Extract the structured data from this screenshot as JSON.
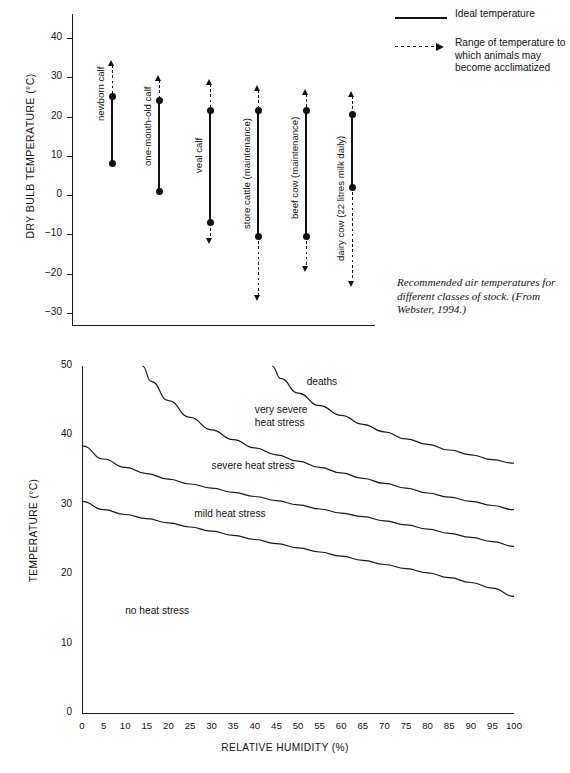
{
  "figure": {
    "caption": "Recommended air temperatures for different classes of stock. (From Webster, 1994.)"
  },
  "legend": {
    "items": [
      {
        "key": "solid-line",
        "label": "Ideal temperature"
      },
      {
        "key": "dashed-arrow-line",
        "label": "Range of temperature to which animals may become acclimatized"
      }
    ]
  },
  "chart_data": [
    {
      "type": "bar",
      "orientation": "vertical-range",
      "title": "",
      "xlabel": "",
      "ylabel": "DRY BULB TEMPERATURE (°C)",
      "ylim": [
        -35,
        45
      ],
      "yticks": [
        40,
        30,
        20,
        10,
        0,
        -10,
        -20,
        -30
      ],
      "ytick_labels": [
        "40",
        "30",
        "20",
        "10",
        "0",
        "−10",
        "−20",
        "−30"
      ],
      "grid": false,
      "legend_position": "top-right",
      "categories": [
        "newborn calf",
        "one-month-old calf",
        "veal calf",
        "store cattle (maintenance)",
        "beef cow (maintenance)",
        "dairy cow (22 litres milk daily)"
      ],
      "series": [
        {
          "name": "Ideal temperature (lower)",
          "values": [
            8,
            1,
            -7,
            -10.5,
            -10.5,
            2
          ]
        },
        {
          "name": "Ideal temperature (upper)",
          "values": [
            25,
            24,
            21.5,
            21.5,
            21.5,
            20.5
          ]
        },
        {
          "name": "Acclimatized range (lower)",
          "values": [
            8,
            1,
            -12.5,
            -27,
            -19.5,
            -23.5
          ]
        },
        {
          "name": "Acclimatized range (upper)",
          "values": [
            34.5,
            30.5,
            29.5,
            28,
            27,
            26.5
          ]
        }
      ]
    },
    {
      "type": "line",
      "title": "",
      "xlabel": "RELATIVE HUMIDITY (%)",
      "ylabel": "TEMPERATURE (°C)",
      "xlim": [
        0,
        100
      ],
      "ylim": [
        0,
        50
      ],
      "xticks": [
        0,
        5,
        10,
        15,
        20,
        25,
        30,
        35,
        40,
        45,
        50,
        55,
        60,
        65,
        70,
        75,
        80,
        85,
        90,
        95,
        100
      ],
      "yticks": [
        0,
        10,
        20,
        30,
        40,
        50
      ],
      "grid": false,
      "legend_position": "none",
      "annotations": [
        {
          "text": "deaths",
          "x": 52,
          "y": 47.5
        },
        {
          "text": "very severe heat stress",
          "x": 40,
          "y": 43.5
        },
        {
          "text": "severe heat stress",
          "x": 30,
          "y": 35.5
        },
        {
          "text": "mild heat stress",
          "x": 26,
          "y": 28.5
        },
        {
          "text": "no heat stress",
          "x": 10,
          "y": 14.5
        }
      ],
      "series": [
        {
          "name": "deaths boundary",
          "x": [
            44,
            46,
            50,
            55,
            60,
            65,
            70,
            75,
            80,
            85,
            90,
            95,
            100
          ],
          "y": [
            50,
            48.2,
            46.1,
            44.3,
            42.9,
            41.6,
            40.5,
            39.5,
            38.7,
            37.9,
            37.2,
            36.5,
            36.0
          ]
        },
        {
          "name": "very severe heat stress boundary",
          "x": [
            14,
            16,
            20,
            25,
            30,
            35,
            40,
            45,
            50,
            55,
            60,
            65,
            70,
            75,
            80,
            85,
            90,
            95,
            100
          ],
          "y": [
            50,
            47.8,
            45.0,
            42.6,
            40.8,
            39.4,
            38.2,
            37.2,
            36.3,
            35.4,
            34.6,
            33.8,
            33.1,
            32.4,
            31.7,
            31.1,
            30.5,
            29.9,
            29.3
          ]
        },
        {
          "name": "severe heat stress boundary",
          "x": [
            0,
            5,
            10,
            15,
            20,
            25,
            30,
            35,
            40,
            45,
            50,
            55,
            60,
            65,
            70,
            75,
            80,
            85,
            90,
            95,
            100
          ],
          "y": [
            38.5,
            36.6,
            35.4,
            34.5,
            33.7,
            33.0,
            32.4,
            31.8,
            31.2,
            30.6,
            30.0,
            29.4,
            28.8,
            28.3,
            27.7,
            27.1,
            26.5,
            25.9,
            25.3,
            24.7,
            24.0
          ]
        },
        {
          "name": "mild heat stress boundary",
          "x": [
            0,
            5,
            10,
            15,
            20,
            25,
            30,
            35,
            40,
            45,
            50,
            55,
            60,
            65,
            70,
            75,
            80,
            85,
            90,
            95,
            100
          ],
          "y": [
            30.5,
            29.3,
            28.6,
            28.0,
            27.4,
            26.8,
            26.2,
            25.6,
            25.0,
            24.4,
            23.8,
            23.2,
            22.6,
            22.0,
            21.4,
            20.8,
            20.2,
            19.5,
            18.8,
            18.0,
            16.8
          ]
        }
      ]
    }
  ]
}
